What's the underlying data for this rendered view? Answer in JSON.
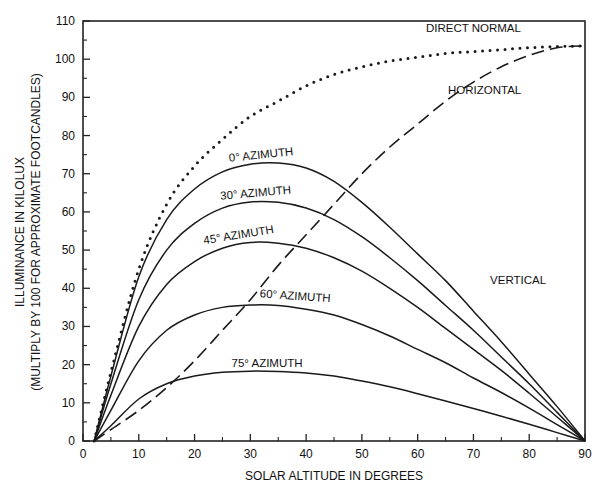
{
  "chart_data": {
    "type": "line",
    "title": "",
    "xlabel": "SOLAR ALTITUDE IN DEGREES",
    "ylabel": "ILLUMINANCE IN KILOLUX",
    "ylabel2": "(MULTIPLY BY 100 FOR APPROXIMATE FOOTCANDLES)",
    "xlim": [
      0,
      90
    ],
    "ylim": [
      0,
      110
    ],
    "xticks": [
      0,
      10,
      20,
      30,
      40,
      50,
      60,
      70,
      80,
      90
    ],
    "yticks": [
      0,
      10,
      20,
      30,
      40,
      50,
      60,
      70,
      80,
      90,
      100,
      110
    ],
    "grid": false,
    "x": [
      2,
      5,
      10,
      15,
      20,
      25,
      30,
      35,
      40,
      45,
      50,
      55,
      60,
      65,
      70,
      75,
      80,
      85,
      90
    ],
    "series": [
      {
        "name": "DIRECT NORMAL",
        "style": "dotted",
        "values": [
          0,
          18,
          45,
          62,
          72,
          79,
          85,
          89,
          93,
          96,
          98,
          99.5,
          100.5,
          101.5,
          102,
          102.5,
          103,
          103.3,
          103.5
        ]
      },
      {
        "name": "HORIZONTAL",
        "style": "dashed",
        "values": [
          0,
          3,
          8,
          14,
          21,
          29,
          37,
          46,
          54,
          62,
          70,
          77,
          83,
          89,
          94,
          98,
          101,
          103,
          103.5
        ]
      },
      {
        "name": "0° AZIMUTH",
        "style": "solid",
        "values": [
          0,
          17,
          43,
          58,
          66,
          70.5,
          72.5,
          72.8,
          71.5,
          68,
          62.5,
          56,
          49,
          42,
          34,
          26,
          17.5,
          9,
          0
        ]
      },
      {
        "name": "30° AZIMUTH",
        "style": "solid",
        "values": [
          0,
          15,
          37,
          50,
          57,
          61,
          62.6,
          62.5,
          61,
          58,
          53.5,
          48,
          42,
          35.5,
          29,
          22,
          15,
          7.5,
          0
        ]
      },
      {
        "name": "45° AZIMUTH",
        "style": "solid",
        "values": [
          0,
          12,
          30,
          41,
          47,
          50.5,
          52,
          51.8,
          50.5,
          48,
          44.5,
          40,
          35,
          29.5,
          24,
          18.5,
          12.5,
          6.3,
          0
        ]
      },
      {
        "name": "60° AZIMUTH",
        "style": "solid",
        "values": [
          0,
          8,
          21,
          29,
          33,
          35,
          35.6,
          35.5,
          34.5,
          33,
          30.5,
          27.5,
          24,
          20.5,
          16.5,
          12.7,
          8.6,
          4.3,
          0
        ]
      },
      {
        "name": "75° AZIMUTH",
        "style": "solid",
        "values": [
          0,
          4,
          11,
          15,
          17,
          18,
          18.3,
          18.2,
          17.8,
          17,
          15.7,
          14.2,
          12.4,
          10.5,
          8.5,
          6.5,
          4.4,
          2.2,
          0
        ]
      }
    ],
    "annotations": [
      {
        "text": "DIRECT NORMAL",
        "x": 70,
        "y": 107
      },
      {
        "text": "HORIZONTAL",
        "x": 72,
        "y": 91
      },
      {
        "text": "VERTICAL",
        "x": 78,
        "y": 41
      },
      {
        "text": "0° AZIMUTH",
        "x": 32,
        "y": 74
      },
      {
        "text": "30° AZIMUTH",
        "x": 31,
        "y": 64
      },
      {
        "text": "45° AZIMUTH",
        "x": 28,
        "y": 53
      },
      {
        "text": "60° AZIMUTH",
        "x": 38,
        "y": 37
      },
      {
        "text": "75° AZIMUTH",
        "x": 33,
        "y": 19.5
      }
    ]
  }
}
